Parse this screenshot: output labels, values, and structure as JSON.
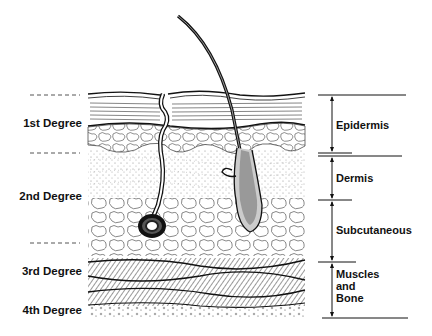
{
  "diagram": {
    "type": "cross-section",
    "degrees": [
      {
        "label": "1st Degree",
        "y": 125
      },
      {
        "label": "2nd Degree",
        "y": 196
      },
      {
        "label": "3rd Degree",
        "y": 272
      },
      {
        "label": "4th Degree",
        "y": 311
      }
    ],
    "dashed_separators_y": [
      95,
      153,
      243
    ],
    "layers": [
      {
        "label": "Epidermis",
        "top": 95,
        "bottom": 153
      },
      {
        "label": "Dermis",
        "top": 156,
        "bottom": 200
      },
      {
        "label": "Subcutaneous",
        "top": 200,
        "bottom": 262
      },
      {
        "label": "Muscles\nand\nBone",
        "top": 262,
        "bottom": 318
      }
    ],
    "colors": {
      "ink": "#1a1a1a",
      "paper": "#ffffff",
      "dash": "#555555"
    }
  }
}
